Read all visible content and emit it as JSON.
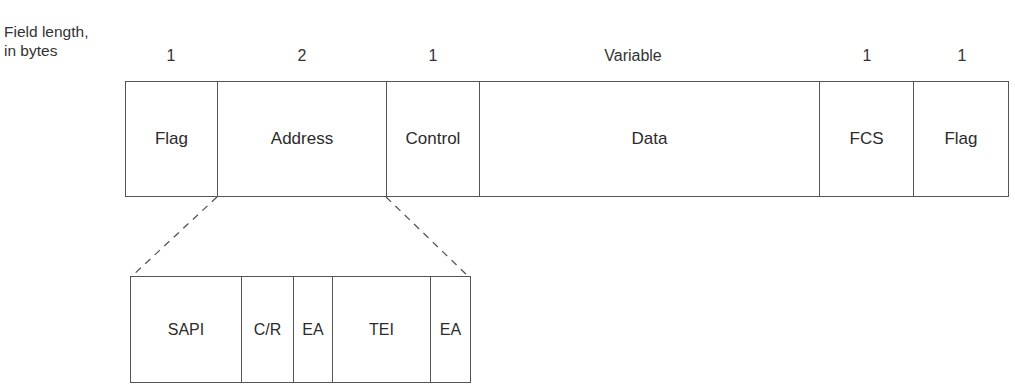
{
  "diagram": {
    "type": "frame-format",
    "field_length_label": "Field length,\nin bytes",
    "field_length_label_lines": [
      "Field length,",
      "in bytes"
    ],
    "main_frame": {
      "fields": [
        {
          "name": "Flag",
          "length": "1",
          "width": 92
        },
        {
          "name": "Address",
          "length": "2",
          "width": 169
        },
        {
          "name": "Control",
          "length": "1",
          "width": 93
        },
        {
          "name": "Data",
          "length": "Variable",
          "width": 340
        },
        {
          "name": "FCS",
          "length": "1",
          "width": 94
        },
        {
          "name": "Flag",
          "length": "1",
          "width": 96
        }
      ]
    },
    "expanded_field": {
      "source": "Address",
      "subfields": [
        {
          "name": "SAPI",
          "width": 111
        },
        {
          "name": "C/R",
          "width": 52
        },
        {
          "name": "EA",
          "width": 39
        },
        {
          "name": "TEI",
          "width": 98
        },
        {
          "name": "EA",
          "width": 41
        }
      ]
    },
    "colors": {
      "line": "#555555",
      "text": "#2b2b2b",
      "background": "#ffffff"
    }
  }
}
